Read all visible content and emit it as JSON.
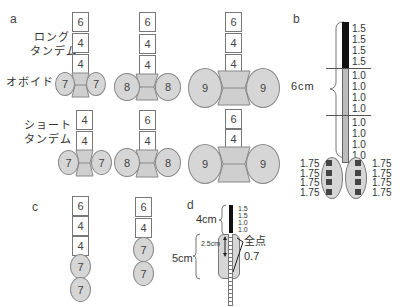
{
  "panels": {
    "a": {
      "label": "a",
      "long_tandem_label": [
        "ロング",
        "タンデム"
      ],
      "ovoid_label": "オボイド",
      "short_tandem_label": [
        "ショート",
        "タンデム"
      ],
      "long_tandem_sets": [
        {
          "tandem": [
            "6",
            "4",
            "4"
          ],
          "ovoid": [
            "7",
            "7"
          ]
        },
        {
          "tandem": [
            "6",
            "4",
            "4"
          ],
          "ovoid": [
            "8",
            "8"
          ]
        },
        {
          "tandem": [
            "6",
            "4",
            "4"
          ],
          "ovoid": [
            "9",
            "9"
          ]
        }
      ],
      "short_tandem_sets": [
        {
          "tandem": [
            "4",
            "4"
          ],
          "ovoid": [
            "7",
            "7"
          ]
        },
        {
          "tandem": [
            "6",
            "4"
          ],
          "ovoid": [
            "8",
            "8"
          ]
        },
        {
          "tandem": [
            "6",
            "4"
          ],
          "ovoid": [
            "9",
            "9"
          ]
        }
      ]
    },
    "b": {
      "label": "b",
      "length_label": "6cm",
      "tandem_weights_dark": [
        "1.5",
        "1.5",
        "1.5",
        "1.5"
      ],
      "tandem_weights_light": [
        "1.0",
        "1.0",
        "1.0",
        "1.0",
        "1.0",
        "1.0",
        "1.0",
        "1.0"
      ],
      "ovoid_left_weights": [
        "1.75",
        "1.75",
        "1.75",
        "1.75"
      ],
      "ovoid_right_weights": [
        "1.75",
        "1.75",
        "1.75",
        "1.75"
      ]
    },
    "c": {
      "label": "c",
      "sets": [
        {
          "tandem": [
            "6",
            "4",
            "4"
          ],
          "ovoid": [
            "7",
            "7"
          ]
        },
        {
          "tandem": [
            "6",
            "4"
          ],
          "ovoid": [
            "7",
            "7"
          ]
        }
      ]
    },
    "d": {
      "label": "d",
      "upper_length": "4cm",
      "lower_length": "5cm",
      "inner_length": "2.5cm",
      "weights": [
        "1.5",
        "1.5",
        "1.0",
        "1.0"
      ],
      "point_label": "全点",
      "point_value": "0.7"
    }
  }
}
